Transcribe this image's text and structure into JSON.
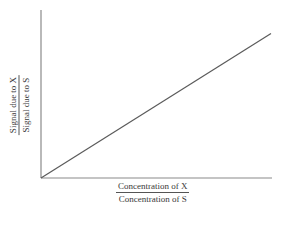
{
  "chart_data": {
    "type": "line",
    "title": "",
    "xlabel": "Concentration of X / Concentration of S",
    "ylabel": "Signal due to X / Signal due to S",
    "xlabel_parts": {
      "numerator": "Concentration of X",
      "denominator": "Concentration of S"
    },
    "ylabel_parts": {
      "numerator": "Signal due to X",
      "denominator": "Signal due to S"
    },
    "series": [
      {
        "name": "calibration line",
        "x": [
          0,
          1
        ],
        "y": [
          0,
          0.86
        ]
      }
    ],
    "xlim": [
      0,
      1
    ],
    "ylim": [
      0,
      1
    ],
    "grid": false,
    "legend": null,
    "ticks": false,
    "colors": {
      "axis": "#8a8a8a",
      "line": "#5a5a5a",
      "text": "#3a3a3a"
    }
  }
}
